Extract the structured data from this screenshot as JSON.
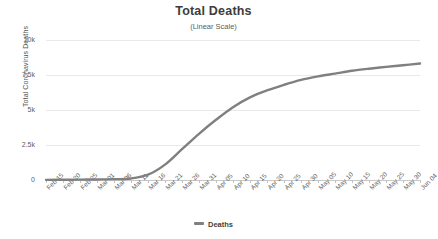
{
  "chart_data": {
    "type": "line",
    "title": "Total Deaths",
    "subtitle": "(Linear Scale)",
    "xlabel": "",
    "ylabel": "Total Coronavirus Deaths",
    "ylim": [
      0,
      10000
    ],
    "ytick_labels": [
      "10k",
      "7.5k",
      "5k",
      "2.5k",
      "0"
    ],
    "ytick_values": [
      10000,
      7500,
      5000,
      2500,
      0
    ],
    "grid": true,
    "legend_position": "bottom",
    "line_color": "#808080",
    "categories": [
      "Feb 15",
      "Feb 20",
      "Feb 25",
      "Mar 01",
      "Mar 06",
      "Mar 11",
      "Mar 16",
      "Mar 21",
      "Mar 26",
      "Mar 31",
      "Apr 05",
      "Apr 10",
      "Apr 15",
      "Apr 20",
      "Apr 25",
      "Apr 30",
      "May 05",
      "May 10",
      "May 15",
      "May 20",
      "May 25",
      "May 30",
      "Jun 04"
    ],
    "series": [
      {
        "name": "Deaths",
        "values": [
          10,
          15,
          25,
          40,
          60,
          110,
          380,
          1100,
          2200,
          3300,
          4300,
          5200,
          5900,
          6400,
          6800,
          7150,
          7400,
          7600,
          7800,
          7950,
          8080,
          8200,
          8320
        ]
      }
    ]
  },
  "legend": {
    "entries": [
      {
        "label": "Deaths",
        "color": "#808080"
      }
    ]
  }
}
